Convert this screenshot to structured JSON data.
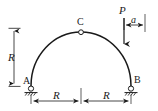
{
  "figure": {
    "type": "engineering-diagram",
    "background_color": "#ffffff",
    "line_color": "#1a1a1a",
    "labels": {
      "support_a": "A",
      "support_b": "B",
      "crown_hinge": "C",
      "load": "P",
      "offset_dim": "a",
      "radius_vertical": "R",
      "span_left": "R",
      "span_right": "R"
    },
    "geometry": {
      "arch_center_x": 81,
      "arch_base_y": 86,
      "arch_radius_x": 50,
      "arch_radius_y": 54,
      "support_a_x": 31,
      "support_b_x": 131,
      "crown_x": 81,
      "crown_y": 32,
      "load_x": 124,
      "load_arrow_top_y": 18,
      "load_arrow_bottom_y": 44,
      "dim_right_edge_x": 145,
      "dim_bottom_y": 101,
      "dim_left_x": 14,
      "dim_top_y": 28
    },
    "elements": {
      "hinge_marker": "open-circle",
      "support_type": "pin-support-hatched",
      "load_direction": "downward-vertical"
    }
  }
}
